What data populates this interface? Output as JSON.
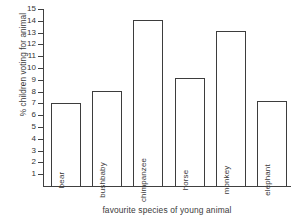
{
  "chart_data": {
    "type": "bar",
    "title": "",
    "xlabel": "favourite species of young animal",
    "ylabel": "% children voting for animal",
    "categories": [
      "bear",
      "bushbaby",
      "chimpanzee",
      "horse",
      "monkey",
      "elephant"
    ],
    "values": [
      7.0,
      8.05,
      14.1,
      9.15,
      13.1,
      7.2
    ],
    "ylim": [
      0,
      15
    ],
    "ytick_labels": [
      "1",
      "2",
      "3",
      "4",
      "5",
      "6",
      "7",
      "8",
      "9",
      "10",
      "11",
      "12",
      "13",
      "14",
      "15"
    ],
    "ytick_values": [
      1,
      2,
      3,
      4,
      5,
      6,
      7,
      8,
      9,
      10,
      11,
      12,
      13,
      14,
      15
    ],
    "grid": false,
    "legend": false,
    "bar_color": "#ffffff",
    "bar_edge_color": "#3d3d3d",
    "axis_color": "#404040",
    "label_placement": "inside-bar-vertical"
  }
}
